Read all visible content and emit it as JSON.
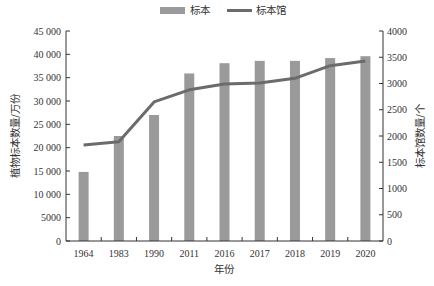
{
  "chart_data": {
    "type": "bar",
    "title": "",
    "categories": [
      "1964",
      "1983",
      "1990",
      "2011",
      "2016",
      "2017",
      "2018",
      "2019",
      "2020"
    ],
    "series": [
      {
        "name": "标本",
        "type": "bar",
        "axis": "left",
        "color": "#9a9a9a",
        "values": [
          14800,
          22500,
          27000,
          35900,
          38100,
          38600,
          38600,
          39200,
          39600
        ]
      },
      {
        "name": "标本馆",
        "type": "line",
        "axis": "right",
        "color": "#6b6b6b",
        "values": [
          1830,
          1890,
          2650,
          2880,
          2990,
          3010,
          3100,
          3340,
          3430
        ]
      }
    ],
    "xlabel": "年份",
    "ylabel": "植物标本数量/万份",
    "y2label": "标本馆数量/个",
    "ylim": [
      0,
      45000
    ],
    "y2lim": [
      0,
      4000
    ],
    "yticks": [
      "0",
      "5000",
      "10 000",
      "15 000",
      "20 000",
      "25 000",
      "30 000",
      "35 000",
      "40 000",
      "45 000"
    ],
    "y2ticks": [
      "0",
      "500",
      "1000",
      "1500",
      "2000",
      "2500",
      "3000",
      "3500",
      "4000"
    ],
    "legend_position": "top",
    "grid": false
  },
  "legend": {
    "bar_label": "标本",
    "line_label": "标本馆"
  }
}
